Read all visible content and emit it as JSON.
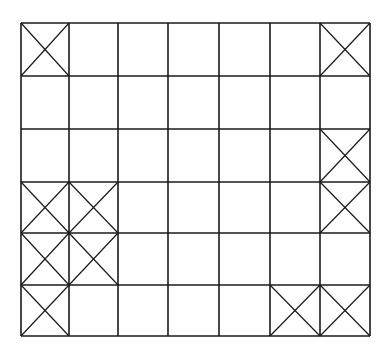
{
  "grid": {
    "rows": 6,
    "cols": 7,
    "col_lines": [
      21,
      69,
      118,
      168,
      219,
      270,
      320,
      370
    ],
    "row_lines": [
      23,
      76,
      129,
      182,
      233,
      285,
      336
    ],
    "line_color": "#1a1a1a",
    "background": "#ffffff",
    "crossed_cells": [
      {
        "row": 0,
        "col": 0
      },
      {
        "row": 0,
        "col": 6
      },
      {
        "row": 2,
        "col": 6
      },
      {
        "row": 3,
        "col": 0
      },
      {
        "row": 3,
        "col": 1
      },
      {
        "row": 3,
        "col": 6
      },
      {
        "row": 4,
        "col": 0
      },
      {
        "row": 4,
        "col": 1
      },
      {
        "row": 5,
        "col": 0
      },
      {
        "row": 5,
        "col": 5
      },
      {
        "row": 5,
        "col": 6
      }
    ]
  }
}
